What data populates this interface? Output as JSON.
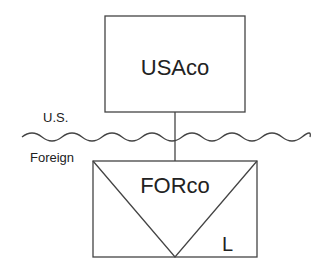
{
  "diagram": {
    "type": "corporate-structure",
    "entities": [
      {
        "id": "usaco",
        "name": "USAco",
        "shape": "rectangle",
        "jurisdiction": "U.S."
      },
      {
        "id": "forco",
        "name": "FORco",
        "shape": "rectangle-with-inverted-triangle",
        "jurisdiction": "Foreign",
        "marker": "L"
      }
    ],
    "relationships": [
      {
        "from": "usaco",
        "to": "forco",
        "type": "ownership"
      }
    ],
    "border": {
      "style": "wavy-line",
      "above_label": "U.S.",
      "below_label": "Foreign"
    },
    "colors": {
      "stroke": "#444444",
      "text": "#222222",
      "background": "#ffffff"
    }
  }
}
